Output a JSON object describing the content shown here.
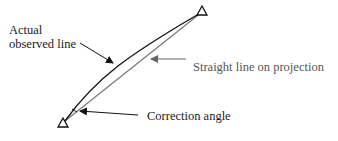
{
  "diagram": {
    "labels": {
      "actual_line_1": "Actual",
      "actual_line_2": "observed line",
      "straight_line": "Straight line on projection",
      "correction_angle": "Correction angle"
    },
    "elements": {
      "start_station": "triangle-marker",
      "end_station": "triangle-marker",
      "observed_line": "curved-line",
      "projection_line": "straight-line"
    },
    "colors": {
      "observed_line": "#111111",
      "projection_line": "#777777",
      "arrow_dark": "#111111",
      "arrow_gray": "#666666",
      "text": "#1a1a1a",
      "text_gray": "#555555"
    }
  }
}
